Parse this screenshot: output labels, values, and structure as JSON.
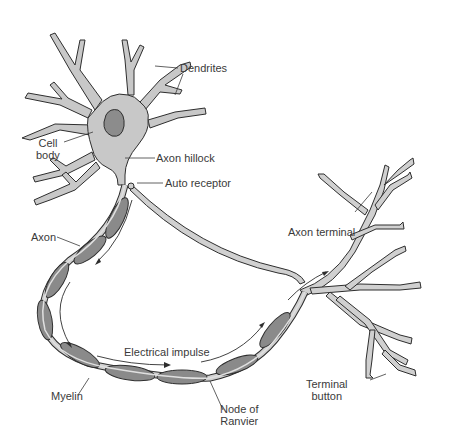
{
  "diagram": {
    "colors": {
      "cell_body": "#c8c8c8",
      "nucleus": "#8c8c8c",
      "myelin": "#8a8a8a",
      "axon": "#d0d0d0",
      "outline": "#2e2e2e",
      "label": "#3a3a3a"
    },
    "labels": {
      "dendrites": "Dendrites",
      "cell_body_1": "Cell",
      "cell_body_2": "body",
      "axon_hillock": "Axon hillock",
      "auto_receptor": "Auto receptor",
      "axon": "Axon",
      "axon_terminal": "Axon terminal",
      "electrical_impulse": "Electrical impulse",
      "myelin": "Myelin",
      "node_1": "Node of",
      "node_2": "Ranvier",
      "terminal_1": "Terminal",
      "terminal_2": "button"
    }
  }
}
